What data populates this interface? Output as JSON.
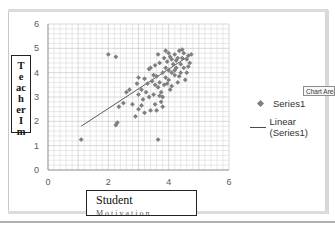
{
  "chart_data": {
    "type": "scatter",
    "title": "",
    "xlabel": "Student Motivation",
    "ylabel": "Teacher Im",
    "xlim": [
      0,
      6
    ],
    "ylim": [
      0,
      6
    ],
    "x_ticks": [
      "0",
      "2",
      "4",
      "6"
    ],
    "y_ticks": [
      "0",
      "1",
      "2",
      "3",
      "4",
      "5",
      "6"
    ],
    "grid": true,
    "legend_position": "right",
    "legend": [
      "Series1",
      "Linear (Series1)"
    ],
    "series": [
      {
        "name": "Series1",
        "marker": "diamond",
        "color": "#7f7f7f",
        "points": [
          [
            1.1,
            1.25
          ],
          [
            2.0,
            4.75
          ],
          [
            2.25,
            4.65
          ],
          [
            2.25,
            1.85
          ],
          [
            2.3,
            1.95
          ],
          [
            2.35,
            2.6
          ],
          [
            2.6,
            3.2
          ],
          [
            2.8,
            2.7
          ],
          [
            2.9,
            2.2
          ],
          [
            3.0,
            3.8
          ],
          [
            3.0,
            2.5
          ],
          [
            3.1,
            3.3
          ],
          [
            3.15,
            2.9
          ],
          [
            3.2,
            2.35
          ],
          [
            3.3,
            3.55
          ],
          [
            3.35,
            3.0
          ],
          [
            3.4,
            4.2
          ],
          [
            3.45,
            3.65
          ],
          [
            3.5,
            3.1
          ],
          [
            3.55,
            2.7
          ],
          [
            3.6,
            3.85
          ],
          [
            3.6,
            2.45
          ],
          [
            3.65,
            3.4
          ],
          [
            3.65,
            1.25
          ],
          [
            3.7,
            4.4
          ],
          [
            3.7,
            3.6
          ],
          [
            3.75,
            3.2
          ],
          [
            3.75,
            2.8
          ],
          [
            3.8,
            4.0
          ],
          [
            3.8,
            3.0
          ],
          [
            3.85,
            4.6
          ],
          [
            3.85,
            3.5
          ],
          [
            3.9,
            4.2
          ],
          [
            3.9,
            3.8
          ],
          [
            3.95,
            4.45
          ],
          [
            4.0,
            4.8
          ],
          [
            4.0,
            4.1
          ],
          [
            4.0,
            3.7
          ],
          [
            4.05,
            3.3
          ],
          [
            4.1,
            4.55
          ],
          [
            4.1,
            4.0
          ],
          [
            4.15,
            4.35
          ],
          [
            4.2,
            4.75
          ],
          [
            4.2,
            3.9
          ],
          [
            4.25,
            4.2
          ],
          [
            4.3,
            4.6
          ],
          [
            4.3,
            3.6
          ],
          [
            4.35,
            4.9
          ],
          [
            4.4,
            4.35
          ],
          [
            4.4,
            4.0
          ],
          [
            4.45,
            4.6
          ],
          [
            4.5,
            4.8
          ],
          [
            4.5,
            4.2
          ],
          [
            4.55,
            3.7
          ],
          [
            4.6,
            4.55
          ],
          [
            4.65,
            4.7
          ],
          [
            4.7,
            4.4
          ],
          [
            4.75,
            4.75
          ],
          [
            3.2,
            3.75
          ],
          [
            3.35,
            4.15
          ],
          [
            3.5,
            3.9
          ],
          [
            2.95,
            3.55
          ],
          [
            3.1,
            2.65
          ],
          [
            3.25,
            3.2
          ],
          [
            3.55,
            3.5
          ],
          [
            3.95,
            3.55
          ],
          [
            4.05,
            4.65
          ],
          [
            4.25,
            4.5
          ],
          [
            4.35,
            3.85
          ],
          [
            4.6,
            4.0
          ],
          [
            3.65,
            4.75
          ],
          [
            3.9,
            4.9
          ],
          [
            4.45,
            4.95
          ],
          [
            2.7,
            3.3
          ],
          [
            3.4,
            2.45
          ],
          [
            3.0,
            3.1
          ],
          [
            3.8,
            2.6
          ],
          [
            4.1,
            3.45
          ],
          [
            4.65,
            4.25
          ],
          [
            3.55,
            4.3
          ],
          [
            2.5,
            2.75
          ],
          [
            3.7,
            3.05
          ],
          [
            4.2,
            4.1
          ]
        ]
      },
      {
        "name": "Linear (Series1)",
        "type": "line",
        "color": "#4a4a4a",
        "points": [
          [
            1.1,
            1.8
          ],
          [
            4.75,
            4.75
          ]
        ]
      }
    ]
  },
  "legend": {
    "series_label": "Series1",
    "trendline_label": "Linear (Series1)"
  },
  "axis_titles": {
    "y_letters": [
      "T",
      "e",
      "ac",
      "h",
      "er",
      "I",
      "m"
    ],
    "x_line1": "Student",
    "x_line2": "Motivation"
  },
  "tooltip": {
    "text": "Chart Area"
  },
  "colors": {
    "marker": "#7f7f7f",
    "trendline": "#4a4a4a",
    "gridline": "#d9d9d9",
    "axis_text": "#595959"
  }
}
